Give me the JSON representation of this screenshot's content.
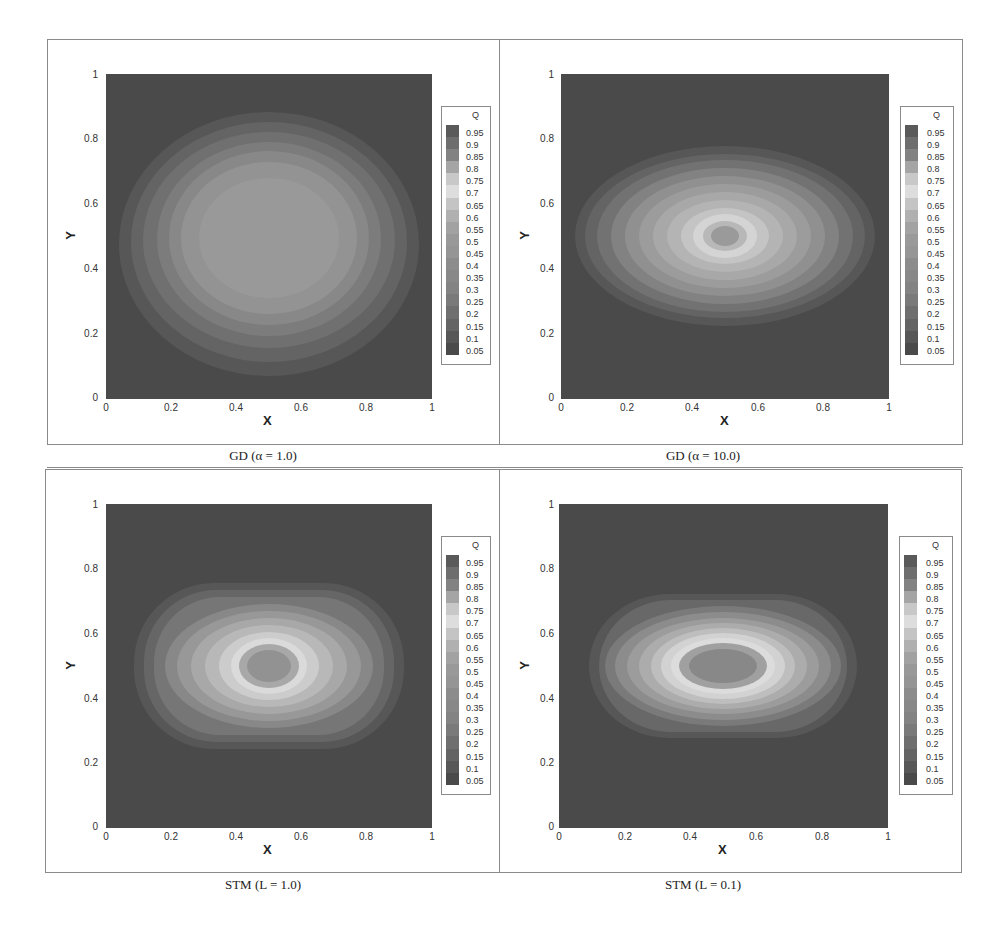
{
  "colormap": {
    "title": "Q",
    "levels": [
      "0.95",
      "0.9",
      "0.85",
      "0.8",
      "0.75",
      "0.7",
      "0.65",
      "0.6",
      "0.55",
      "0.5",
      "0.45",
      "0.4",
      "0.35",
      "0.3",
      "0.25",
      "0.2",
      "0.15",
      "0.1",
      "0.05"
    ],
    "colors": [
      "#5a5a5a",
      "#6e6e6e",
      "#828282",
      "#a5a5a5",
      "#c8c8c8",
      "#dddddd",
      "#c4c4c4",
      "#b0b0b0",
      "#a2a2a2",
      "#999999",
      "#959595",
      "#8c8c8c",
      "#888888",
      "#838383",
      "#7a7a7a",
      "#6f6f6f",
      "#646464",
      "#575757",
      "#4a4a4a"
    ]
  },
  "axes": {
    "xlabel": "X",
    "ylabel": "Y",
    "xticks": [
      "0",
      "0.2",
      "0.4",
      "0.6",
      "0.8",
      "1"
    ],
    "yticks": [
      "0",
      "0.2",
      "0.4",
      "0.6",
      "0.8",
      "1"
    ]
  },
  "panels": [
    {
      "caption": "GD (α = 1.0)"
    },
    {
      "caption": "GD (α = 10.0)"
    },
    {
      "caption": "STM (L = 1.0)"
    },
    {
      "caption": "STM (L = 0.1)"
    }
  ],
  "chart_data": [
    {
      "type": "heatmap",
      "title": "GD (α = 1.0)",
      "xlabel": "X",
      "ylabel": "Y",
      "xlim": [
        0,
        1
      ],
      "ylim": [
        0,
        1
      ],
      "colorbar_title": "Q",
      "colorbar_levels": [
        0.05,
        0.1,
        0.15,
        0.2,
        0.25,
        0.3,
        0.35,
        0.4,
        0.45,
        0.5,
        0.55,
        0.6,
        0.65,
        0.7,
        0.75,
        0.8,
        0.85,
        0.9,
        0.95
      ],
      "description": "Broad round blob centered near (0.5,0.5), extent x≈0.05–0.95, y≈0.1–0.9; smooth maximum ~0.5 at center, background ~0.05"
    },
    {
      "type": "heatmap",
      "title": "GD (α = 10.0)",
      "xlabel": "X",
      "ylabel": "Y",
      "xlim": [
        0,
        1
      ],
      "ylim": [
        0,
        1
      ],
      "colorbar_title": "Q",
      "colorbar_levels": [
        0.05,
        0.1,
        0.15,
        0.2,
        0.25,
        0.3,
        0.35,
        0.4,
        0.45,
        0.5,
        0.55,
        0.6,
        0.65,
        0.7,
        0.75,
        0.8,
        0.85,
        0.9,
        0.95
      ],
      "description": "Elliptical blob centered at (0.5,0.5), extent x≈0.05–0.95, y≈0.22–0.78; bright ring ~0.7 around a small darker core ~0.5"
    },
    {
      "type": "heatmap",
      "title": "STM (L = 1.0)",
      "xlabel": "X",
      "ylabel": "Y",
      "xlim": [
        0,
        1
      ],
      "ylim": [
        0,
        1
      ],
      "colorbar_title": "Q",
      "colorbar_levels": [
        0.05,
        0.1,
        0.15,
        0.2,
        0.25,
        0.3,
        0.35,
        0.4,
        0.45,
        0.5,
        0.55,
        0.6,
        0.65,
        0.7,
        0.75,
        0.8,
        0.85,
        0.9,
        0.95
      ],
      "description": "Rounded-rectangle blob, extent x≈0.1–0.9, y≈0.25–0.75; bright ring ~0.7 with darker core ~0.5 at (0.5,0.5)"
    },
    {
      "type": "heatmap",
      "title": "STM (L = 0.1)",
      "xlabel": "X",
      "ylabel": "Y",
      "xlim": [
        0,
        1
      ],
      "ylim": [
        0,
        1
      ],
      "colorbar_title": "Q",
      "colorbar_levels": [
        0.05,
        0.1,
        0.15,
        0.2,
        0.25,
        0.3,
        0.35,
        0.4,
        0.45,
        0.5,
        0.55,
        0.6,
        0.65,
        0.7,
        0.75,
        0.8,
        0.85,
        0.9,
        0.95
      ],
      "description": "Flattened rounded-rectangle blob, extent x≈0.1–0.9, y≈0.28–0.72; bright ring ~0.7 with wider darker elliptical core ~0.45 at (0.5,0.5)"
    }
  ]
}
